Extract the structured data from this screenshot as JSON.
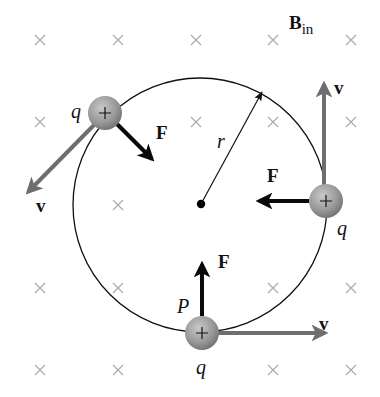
{
  "figure": {
    "field_label": "B",
    "field_subscript": "in",
    "radius_label": "r",
    "point_label": "P",
    "charge_labels": [
      "q",
      "q",
      "q"
    ],
    "force_labels": [
      "F",
      "F",
      "F"
    ],
    "velocity_labels": [
      "v",
      "v",
      "v"
    ],
    "charge_sign": "+",
    "field_symbol": "×",
    "colors": {
      "circle": "#111111",
      "force_arrow": "#0a0a0a",
      "velocity_arrow": "#6e6e6e",
      "field_cross": "#a8a8a8",
      "charge_fill": "#9a9a9a"
    }
  }
}
